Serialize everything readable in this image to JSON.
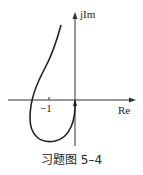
{
  "figure": {
    "caption": "习题图 5–4",
    "axes": {
      "x_label": "Re",
      "y_label": "jIm",
      "tick_label": "−1"
    },
    "curve": {
      "description": "Nyquist plot curve starting near origin going downward-left, looping around through lower half, crossing real axis left of -1, and extending to upper-left region",
      "color": "#222222"
    }
  }
}
